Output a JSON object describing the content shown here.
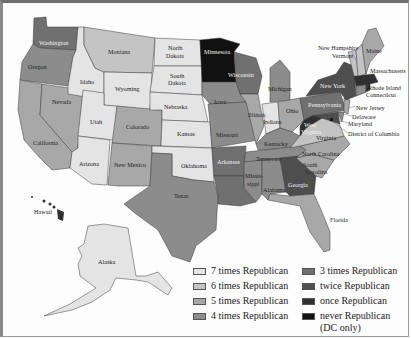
{
  "map": {
    "type": "choropleth",
    "subject": "Number of times each state voted Republican (US presidential elections)",
    "colors": {
      "7": "#e4e4e4",
      "6": "#c4c4c4",
      "5": "#a8a8a8",
      "4": "#8c8c8c",
      "3": "#707070",
      "2": "#4e4e4e",
      "1": "#303030",
      "0": "#111111"
    },
    "states": [
      {
        "name": "Washington",
        "times": 3
      },
      {
        "name": "Oregon",
        "times": 4
      },
      {
        "name": "California",
        "times": 5
      },
      {
        "name": "Nevada",
        "times": 5
      },
      {
        "name": "Idaho",
        "times": 7
      },
      {
        "name": "Montana",
        "times": 6
      },
      {
        "name": "Wyoming",
        "times": 7
      },
      {
        "name": "Utah",
        "times": 7
      },
      {
        "name": "Arizona",
        "times": 7
      },
      {
        "name": "Colorado",
        "times": 5
      },
      {
        "name": "New Mexico",
        "times": 5
      },
      {
        "name": "North Dakota",
        "times": 7
      },
      {
        "name": "South Dakota",
        "times": 7
      },
      {
        "name": "Nebraska",
        "times": 7
      },
      {
        "name": "Kansas",
        "times": 7
      },
      {
        "name": "Oklahoma",
        "times": 7
      },
      {
        "name": "Texas",
        "times": 4
      },
      {
        "name": "Minnesota",
        "times": 0
      },
      {
        "name": "Iowa",
        "times": 4
      },
      {
        "name": "Missouri",
        "times": 4
      },
      {
        "name": "Arkansas",
        "times": 3
      },
      {
        "name": "Louisiana",
        "times": 3
      },
      {
        "name": "Wisconsin",
        "times": 3
      },
      {
        "name": "Illinois",
        "times": 5
      },
      {
        "name": "Michigan",
        "times": 4
      },
      {
        "name": "Indiana",
        "times": 7
      },
      {
        "name": "Ohio",
        "times": 5
      },
      {
        "name": "Kentucky",
        "times": 4
      },
      {
        "name": "Tennessee",
        "times": 4
      },
      {
        "name": "Mississippi",
        "times": 4
      },
      {
        "name": "Alabama",
        "times": 4
      },
      {
        "name": "Georgia",
        "times": 2
      },
      {
        "name": "Florida",
        "times": 5
      },
      {
        "name": "South Carolina",
        "times": 5
      },
      {
        "name": "North Carolina",
        "times": 5
      },
      {
        "name": "Virginia",
        "times": 6
      },
      {
        "name": "West Virginia",
        "times": 1
      },
      {
        "name": "Pennsylvania",
        "times": 3
      },
      {
        "name": "New York",
        "times": 2
      },
      {
        "name": "Maine",
        "times": 5
      },
      {
        "name": "New Hampshire",
        "times": 6
      },
      {
        "name": "Vermont",
        "times": 6
      },
      {
        "name": "Massachusetts",
        "times": 1
      },
      {
        "name": "Rhode Island",
        "times": 1
      },
      {
        "name": "Connecticut",
        "times": 4
      },
      {
        "name": "New Jersey",
        "times": 5
      },
      {
        "name": "Delaware",
        "times": 4
      },
      {
        "name": "Maryland",
        "times": 2
      },
      {
        "name": "District of Columbia",
        "times": 0
      },
      {
        "name": "Hawaii",
        "times": 1
      },
      {
        "name": "Alaska",
        "times": 7
      }
    ],
    "labels": {
      "washington": "Washington",
      "oregon": "Oregon",
      "california": "California",
      "nevada": "Nevada",
      "idaho": "Idaho",
      "montana": "Montana",
      "wyoming": "Wyoming",
      "utah": "Utah",
      "arizona": "Arizona",
      "colorado": "Colorado",
      "new_mexico": "New Mexico",
      "north_dakota_1": "North",
      "north_dakota_2": "Dakota",
      "south_dakota_1": "South",
      "south_dakota_2": "Dakota",
      "nebraska": "Nebraska",
      "kansas": "Kansas",
      "oklahoma": "Oklahoma",
      "texas": "Texas",
      "minnesota": "Minnesota",
      "iowa": "Iowa",
      "missouri": "Missouri",
      "arkansas": "Arkansas",
      "louisiana": "Louisiana",
      "wisconsin": "Wisconsin",
      "illinois": "Illinois",
      "michigan": "Michigan",
      "indiana": "Indiana",
      "ohio": "Ohio",
      "kentucky": "Kentucky",
      "tennessee": "Tennessee",
      "mississippi_1": "Missis-",
      "mississippi_2": "sippi",
      "alabama": "Alabama",
      "georgia": "Georgia",
      "florida": "Florida",
      "south_carolina_1": "South",
      "south_carolina_2": "Carolina",
      "north_carolina": "North Carolina",
      "virginia": "Virginia",
      "west_virginia_1": "West",
      "west_virginia_2": "Virginia",
      "pennsylvania": "Pennsylvania",
      "new_york": "New York",
      "maine": "Maine",
      "new_hampshire": "New Hampshire",
      "vermont": "Vermont",
      "massachusetts": "Massachusetts",
      "rhode_island": "Rhode Island",
      "connecticut": "Connecticut",
      "new_jersey": "New Jersey",
      "delaware": "Delaware",
      "maryland": "Maryland",
      "dc": "District of Columbia",
      "hawaii": "Hawaii",
      "alaska": "Alaska"
    }
  },
  "legend": {
    "items": [
      {
        "label": "7 times Republican",
        "color": "#e4e4e4"
      },
      {
        "label": "6 times Republican",
        "color": "#c4c4c4"
      },
      {
        "label": "5 times Republican",
        "color": "#a8a8a8"
      },
      {
        "label": "4 times Republican",
        "color": "#8c8c8c"
      },
      {
        "label": "3 times Republican",
        "color": "#707070"
      },
      {
        "label": "twice Republican",
        "color": "#4e4e4e"
      },
      {
        "label": "once Republican",
        "color": "#303030"
      },
      {
        "label": "never Republican",
        "color": "#111111",
        "note": "(DC only)"
      }
    ]
  }
}
